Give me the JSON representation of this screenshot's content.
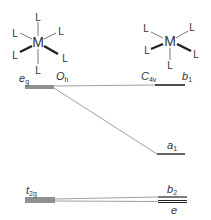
{
  "diagram": {
    "type": "orbital-correlation-diagram",
    "left_complex": {
      "metal": "M",
      "ligand": "L",
      "symmetry": {
        "main": "O",
        "sub": "h"
      },
      "ligand_count": 6
    },
    "right_complex": {
      "metal": "M",
      "ligand": "L",
      "symmetry": {
        "main": "C",
        "sub": "4v"
      },
      "ligand_count": 5
    },
    "levels_left": [
      {
        "main": "e",
        "sub": "g",
        "degeneracy": 2
      },
      {
        "main": "t",
        "sub": "2g",
        "degeneracy": 3
      }
    ],
    "levels_right": [
      {
        "main": "b",
        "sub": "1",
        "degeneracy": 1
      },
      {
        "main": "a",
        "sub": "1",
        "degeneracy": 1
      },
      {
        "main": "b",
        "sub": "2",
        "degeneracy": 1
      },
      {
        "main": "e",
        "sub": "",
        "degeneracy": 2
      }
    ],
    "colors": {
      "line": "#333333",
      "connector": "#777777"
    }
  }
}
